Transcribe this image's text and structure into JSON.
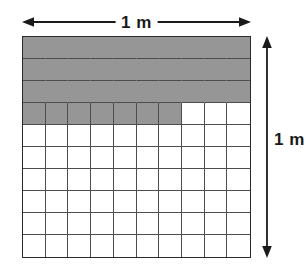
{
  "figure": {
    "top_dimension": {
      "label": "1 m",
      "icon_left": "arrow-left-icon",
      "icon_right": "arrow-right-icon"
    },
    "right_dimension": {
      "label": "1 m",
      "icon_top": "arrow-up-icon",
      "icon_bottom": "arrow-down-icon"
    }
  },
  "chart_data": {
    "type": "heatmap",
    "xlabel": "1 m",
    "ylabel": "1 m",
    "rows": 10,
    "columns": 10,
    "total_cells": 100,
    "shaded_cells": 37,
    "shaded_fraction": 0.37,
    "shaded_area_m2": 0.37,
    "side_length_m": 1,
    "cell_side_length_m": 0.1,
    "cell_area_m2": 0.01,
    "grid": [
      [
        1,
        1,
        1,
        1,
        1,
        1,
        1,
        1,
        1,
        1
      ],
      [
        1,
        1,
        1,
        1,
        1,
        1,
        1,
        1,
        1,
        1
      ],
      [
        1,
        1,
        1,
        1,
        1,
        1,
        1,
        1,
        1,
        1
      ],
      [
        1,
        1,
        1,
        1,
        1,
        1,
        1,
        0,
        0,
        0
      ],
      [
        0,
        0,
        0,
        0,
        0,
        0,
        0,
        0,
        0,
        0
      ],
      [
        0,
        0,
        0,
        0,
        0,
        0,
        0,
        0,
        0,
        0
      ],
      [
        0,
        0,
        0,
        0,
        0,
        0,
        0,
        0,
        0,
        0
      ],
      [
        0,
        0,
        0,
        0,
        0,
        0,
        0,
        0,
        0,
        0
      ],
      [
        0,
        0,
        0,
        0,
        0,
        0,
        0,
        0,
        0,
        0
      ],
      [
        0,
        0,
        0,
        0,
        0,
        0,
        0,
        0,
        0,
        0
      ]
    ],
    "row_shaded_counts": [
      10,
      10,
      10,
      7,
      0,
      0,
      0,
      0,
      0,
      0
    ],
    "full_shaded_rows": [
      1,
      2,
      3
    ],
    "partial_shaded_rows": [
      {
        "row": 4,
        "shaded": 7,
        "of": 10
      }
    ],
    "legend": [
      {
        "name": "shaded",
        "color": "#969696"
      },
      {
        "name": "unshaded",
        "color": "#ffffff"
      }
    ],
    "colors": {
      "shaded": "#969696",
      "unshaded": "#ffffff",
      "gridline": "#4d4d4d",
      "border": "#2b2b2b",
      "arrow": "#1a1a1a",
      "text": "#1a1a1a"
    },
    "grid_visible": true,
    "legend_position": "none"
  }
}
